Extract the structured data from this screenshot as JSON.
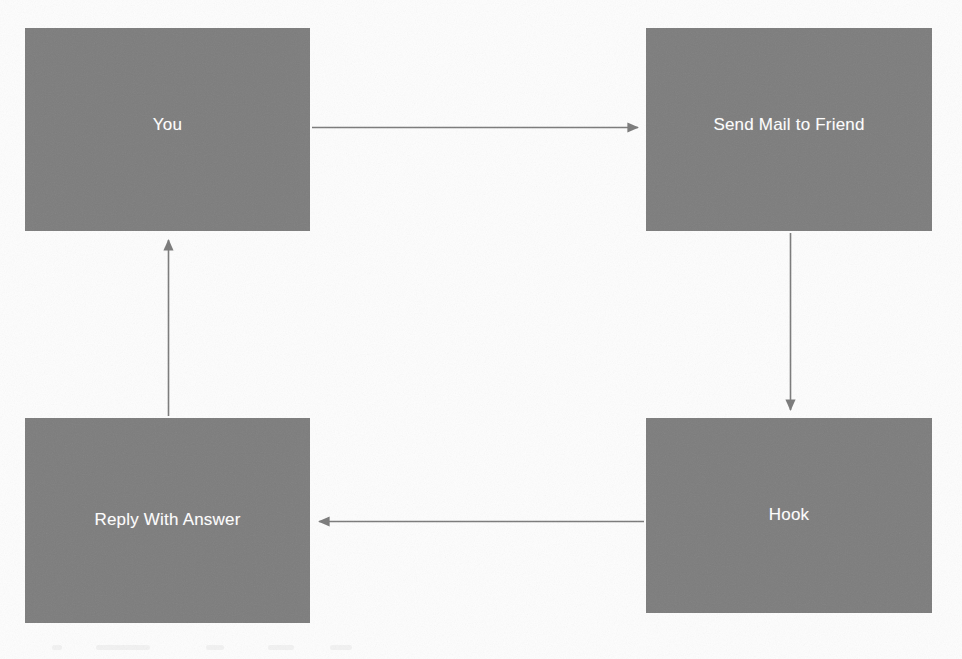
{
  "diagram": {
    "type": "cycle-flowchart",
    "canvas": {
      "width": 962,
      "height": 659
    },
    "style": {
      "node_fill": "#7d7d7d",
      "node_text_color": "#ffffff",
      "connector_color": "#7a7a7a",
      "background": "#fdfdfd"
    },
    "nodes": [
      {
        "id": "you",
        "label": "You",
        "position": "top-left",
        "x": 25,
        "y": 28,
        "width": 285,
        "height": 203
      },
      {
        "id": "send-mail",
        "label": "Send Mail to Friend",
        "position": "top-right",
        "x": 646,
        "y": 28,
        "width": 286,
        "height": 203
      },
      {
        "id": "reply",
        "label": "Reply With Answer",
        "position": "bottom-left",
        "x": 25,
        "y": 418,
        "width": 285,
        "height": 205
      },
      {
        "id": "hook",
        "label": "Hook",
        "position": "bottom-right",
        "x": 646,
        "y": 418,
        "width": 286,
        "height": 195
      }
    ],
    "connectors": [
      {
        "id": "you-to-send-mail",
        "from": "you",
        "to": "send-mail",
        "direction": "right",
        "label": ""
      },
      {
        "id": "send-mail-to-hook",
        "from": "send-mail",
        "to": "hook",
        "direction": "down",
        "label": ""
      },
      {
        "id": "hook-to-reply",
        "from": "hook",
        "to": "reply",
        "direction": "left",
        "label": ""
      },
      {
        "id": "reply-to-you",
        "from": "reply",
        "to": "you",
        "direction": "up",
        "label": ""
      }
    ]
  }
}
